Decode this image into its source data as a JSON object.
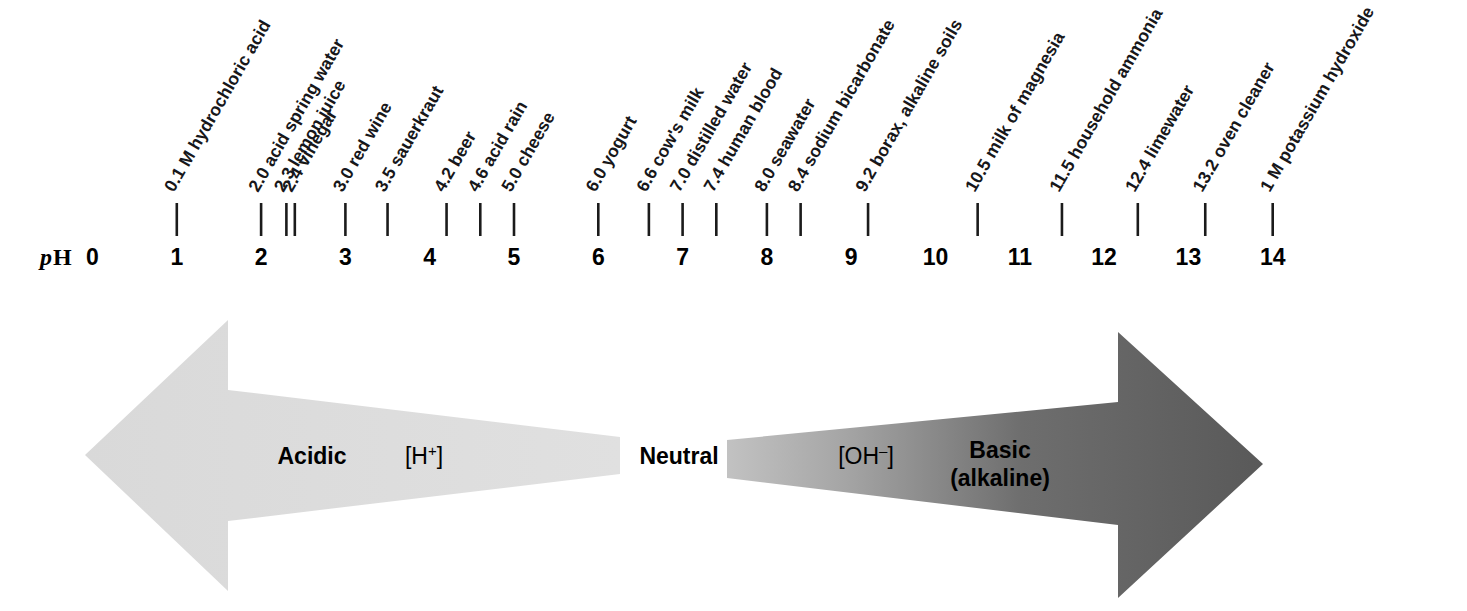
{
  "figure": {
    "axis_title_prefix": "p",
    "axis_title_suffix": "H",
    "axis_min": 0,
    "axis_max": 14,
    "background_color": "#ffffff"
  },
  "chart_data": {
    "type": "scatter",
    "xlabel": "pH",
    "ylabel": "",
    "xlim": [
      0,
      14
    ],
    "grid": false,
    "legend": "none",
    "tick_labels": [
      "0",
      "1",
      "2",
      "3",
      "4",
      "5",
      "6",
      "7",
      "8",
      "9",
      "10",
      "11",
      "12",
      "13",
      "14"
    ],
    "x": [
      1.0,
      2.0,
      2.3,
      2.4,
      3.0,
      3.5,
      4.2,
      4.6,
      5.0,
      6.0,
      6.6,
      7.0,
      7.4,
      8.0,
      8.4,
      9.2,
      10.5,
      11.5,
      12.4,
      13.2,
      14.0
    ],
    "point_labels": [
      "0.1 M hydrochloric acid",
      "2.0 acid spring water",
      "2.3 lemon juice",
      "2.4 vinegar",
      "3.0 red wine",
      "3.5 sauerkraut",
      "4.2 beer",
      "4.6 acid rain",
      "5.0 cheese",
      "6.0 yogurt",
      "6.6 cow's milk",
      "7.0 distilled water",
      "7.4 human blood",
      "8.0 seawater",
      "8.4 sodium bicarbonate",
      "9.2 borax, alkaline soils",
      "10.5 milk of magnesia",
      "11.5 household ammonia",
      "12.4 limewater",
      "13.2 oven cleaner",
      "1 M potassium hydroxide"
    ],
    "annotations": [
      {
        "text": "Acidic",
        "x_range": [
          0,
          7
        ],
        "color": "#dcdcdc"
      },
      {
        "text": "[H+]",
        "x_range": [
          0,
          7
        ],
        "color": "#dcdcdc"
      },
      {
        "text": "Neutral",
        "x": 7,
        "color": "#000000"
      },
      {
        "text": "[OH-]",
        "x_range": [
          7,
          14
        ],
        "color": "#595959"
      },
      {
        "text": "Basic (alkaline)",
        "x_range": [
          7,
          14
        ],
        "color": "#595959"
      }
    ]
  },
  "samples": [
    {
      "ph": 1.0,
      "label": "0.1 M hydrochloric acid"
    },
    {
      "ph": 2.0,
      "label": "2.0 acid spring water"
    },
    {
      "ph": 2.3,
      "label": "2.3 lemon juice"
    },
    {
      "ph": 2.4,
      "label": "2.4 vinegar"
    },
    {
      "ph": 3.0,
      "label": "3.0 red wine"
    },
    {
      "ph": 3.5,
      "label": "3.5 sauerkraut"
    },
    {
      "ph": 4.2,
      "label": "4.2 beer"
    },
    {
      "ph": 4.6,
      "label": "4.6 acid rain"
    },
    {
      "ph": 5.0,
      "label": "5.0 cheese"
    },
    {
      "ph": 6.0,
      "label": "6.0 yogurt"
    },
    {
      "ph": 6.6,
      "label": "6.6 cow's milk"
    },
    {
      "ph": 7.0,
      "label": "7.0 distilled water"
    },
    {
      "ph": 7.4,
      "label": "7.4 human blood"
    },
    {
      "ph": 8.0,
      "label": "8.0 seawater"
    },
    {
      "ph": 8.4,
      "label": "8.4 sodium bicarbonate"
    },
    {
      "ph": 9.2,
      "label": "9.2 borax, alkaline soils"
    },
    {
      "ph": 10.5,
      "label": "10.5 milk of magnesia"
    },
    {
      "ph": 11.5,
      "label": "11.5 household ammonia"
    },
    {
      "ph": 12.4,
      "label": "12.4 limewater"
    },
    {
      "ph": 13.2,
      "label": "13.2 oven cleaner"
    },
    {
      "ph": 14.0,
      "label": "1 M potassium hydroxide"
    }
  ],
  "axis": {
    "title_prefix": "p",
    "title_suffix": "H",
    "numbers": [
      "0",
      "1",
      "2",
      "3",
      "4",
      "5",
      "6",
      "7",
      "8",
      "9",
      "10",
      "11",
      "12",
      "13",
      "14"
    ]
  },
  "arrows": {
    "left": {
      "zone_label": "Acidic",
      "ion_base": "[H",
      "ion_sup": "+",
      "ion_close": "]",
      "color": "#dcdcdc"
    },
    "center": {
      "label": "Neutral",
      "color": "#000000"
    },
    "right": {
      "zone_label_line1": "Basic",
      "zone_label_line2": "(alkaline)",
      "ion_base": "[OH",
      "ion_sup": "–",
      "ion_close": "]",
      "color_light": "#b4b4b4",
      "color_dark": "#595959"
    }
  }
}
